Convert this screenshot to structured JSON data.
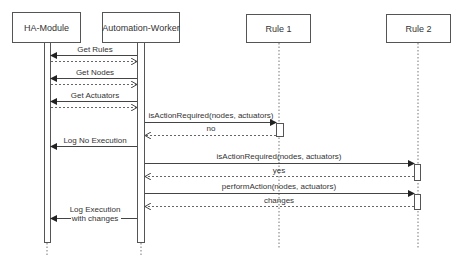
{
  "diagram": {
    "type": "sequence",
    "participants": [
      {
        "id": "ha",
        "label": "HA-Module"
      },
      {
        "id": "aw",
        "label": "Automation-Worker"
      },
      {
        "id": "r1",
        "label": "Rule 1"
      },
      {
        "id": "r2",
        "label": "Rule 2"
      }
    ],
    "messages": [
      {
        "from": "aw",
        "to": "ha",
        "label": "Get Rules",
        "style": "sync"
      },
      {
        "from": "ha",
        "to": "aw",
        "label": "",
        "style": "return"
      },
      {
        "from": "aw",
        "to": "ha",
        "label": "Get Nodes",
        "style": "sync"
      },
      {
        "from": "ha",
        "to": "aw",
        "label": "",
        "style": "return"
      },
      {
        "from": "aw",
        "to": "ha",
        "label": "Get Actuators",
        "style": "sync"
      },
      {
        "from": "ha",
        "to": "aw",
        "label": "",
        "style": "return"
      },
      {
        "from": "aw",
        "to": "r1",
        "label": "isActionRequired(nodes, actuators)",
        "style": "sync"
      },
      {
        "from": "r1",
        "to": "aw",
        "label": "no",
        "style": "return"
      },
      {
        "from": "aw",
        "to": "ha",
        "label": "Log No Execution",
        "style": "sync"
      },
      {
        "from": "aw",
        "to": "r2",
        "label": "isActionRequired(nodes, actuators)",
        "style": "sync"
      },
      {
        "from": "r2",
        "to": "aw",
        "label": "yes",
        "style": "return"
      },
      {
        "from": "aw",
        "to": "r2",
        "label": "performAction(nodes, actuators)",
        "style": "sync"
      },
      {
        "from": "r2",
        "to": "aw",
        "label": "changes",
        "style": "return"
      },
      {
        "from": "aw",
        "to": "ha",
        "label_line1": "Log Execution",
        "label_line2": "with changes",
        "style": "sync"
      }
    ]
  },
  "colors": {
    "line": "#444444",
    "box_border": "#555555",
    "text": "#333333",
    "background": "#ffffff"
  }
}
